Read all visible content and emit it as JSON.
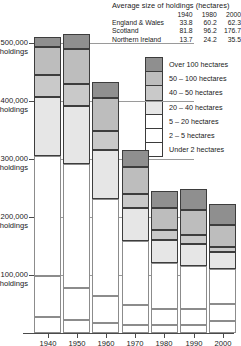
{
  "table": {
    "title": "Average size of holdings (hectares)",
    "columns": [
      "1940",
      "1980",
      "2000"
    ],
    "rows": [
      {
        "label": "England & Wales",
        "values": [
          "33.8",
          "60.2",
          "62.3"
        ]
      },
      {
        "label": "Scotland",
        "values": [
          "81.8",
          "96.2",
          "176.7"
        ]
      },
      {
        "label": "Northern Ireland",
        "values": [
          "13.7",
          "24.2",
          "35.5"
        ]
      }
    ]
  },
  "legend": {
    "items": [
      {
        "label": "Over 100 hectares",
        "color": "#8f8f8f"
      },
      {
        "label": "50 – 100 hectares",
        "color": "#bdbdbd"
      },
      {
        "label": "40 – 50 hectares",
        "color": "#c9c9c9"
      },
      {
        "label": "20 – 40 hectares",
        "color": "#e6e6e6"
      },
      {
        "label": "5 – 20 hectares",
        "color": "#ffffff"
      },
      {
        "label": "2 – 5 hectares",
        "color": "#ffffff"
      },
      {
        "label": "Under 2 hectares",
        "color": "#ffffff"
      }
    ]
  },
  "chart_data": {
    "type": "bar",
    "stacked": true,
    "title": "",
    "xlabel": "",
    "ylabel": "holdings",
    "ylim": [
      0,
      560000
    ],
    "grid": true,
    "legend_position": "right",
    "ytick_labels": [
      "100,000\nholdings",
      "200,000\nholdings",
      "300,000\nholdings",
      "400,000\nholdings",
      "500,000\nholdings"
    ],
    "ytick_values": [
      100000,
      200000,
      300000,
      400000,
      500000
    ],
    "categories": [
      "1940",
      "1950",
      "1960",
      "1970",
      "1980",
      "1990",
      "2000"
    ],
    "series": [
      {
        "name": "Under 2 hectares",
        "color": "#ffffff",
        "values": [
          27000,
          23000,
          18000,
          14000,
          14000,
          14000,
          21000
        ]
      },
      {
        "name": "2 – 5 hectares",
        "color": "#ffffff",
        "values": [
          72000,
          55000,
          45000,
          34000,
          28000,
          27000,
          29000
        ]
      },
      {
        "name": "5 – 20 hectares",
        "color": "#ffffff",
        "values": [
          207000,
          213000,
          168000,
          110000,
          78000,
          74000,
          60000
        ]
      },
      {
        "name": "20 – 40 hectares",
        "color": "#e6e6e6",
        "values": [
          101000,
          100000,
          84000,
          57000,
          41000,
          38000,
          29000
        ]
      },
      {
        "name": "40 – 50 hectares",
        "color": "#c9c9c9",
        "values": [
          38000,
          38000,
          33000,
          24000,
          16000,
          16000,
          10000
        ]
      },
      {
        "name": "50 – 100 hectares",
        "color": "#bdbdbd",
        "values": [
          48000,
          60000,
          57000,
          47000,
          38000,
          43000,
          38000
        ]
      },
      {
        "name": "Over 100 hectares",
        "color": "#8f8f8f",
        "values": [
          17000,
          26000,
          28000,
          29000,
          30000,
          36000,
          35000
        ]
      }
    ],
    "totals": [
      510000,
      515000,
      433000,
      315000,
      245000,
      248000,
      222000
    ]
  }
}
